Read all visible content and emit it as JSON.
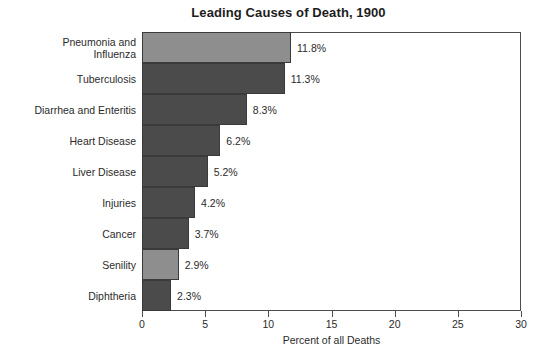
{
  "chart_data": {
    "type": "bar",
    "orientation": "horizontal",
    "title": "Leading Causes of Death, 1900",
    "xlabel": "Percent of all Deaths",
    "ylabel": "",
    "xlim": [
      0,
      30
    ],
    "xticks": [
      0,
      5,
      10,
      15,
      20,
      25,
      30
    ],
    "xtick_labels": [
      "0",
      "5",
      "10",
      "15",
      "20",
      "25",
      "30"
    ],
    "grid": false,
    "legend": null,
    "categories": [
      "Pneumonia and\nInfluenza",
      "Tuberculosis",
      "Diarrhea and Enteritis",
      "Heart Disease",
      "Liver Disease",
      "Injuries",
      "Cancer",
      "Senility",
      "Diphtheria"
    ],
    "values": [
      11.8,
      11.3,
      8.3,
      6.2,
      5.2,
      4.2,
      3.7,
      2.9,
      2.3
    ],
    "data_labels": [
      "11.8%",
      "11.3%",
      "8.3%",
      "6.2%",
      "5.2%",
      "4.2%",
      "3.7%",
      "2.9%",
      "2.3%"
    ],
    "bar_shades": [
      "light",
      "dark",
      "dark",
      "dark",
      "dark",
      "dark",
      "dark",
      "light",
      "dark"
    ],
    "colors": {
      "bar_light": "#8e8e8e",
      "bar_dark": "#4b4b4b",
      "bar_outline": "#3a3a3a",
      "axis": "#4d4d4d",
      "text": "#2b2b2b",
      "background": "#ffffff"
    }
  }
}
